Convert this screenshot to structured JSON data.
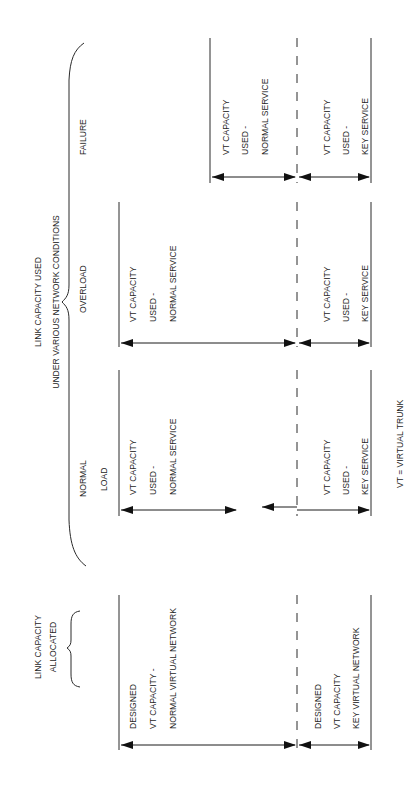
{
  "figure": {
    "orientation": "rotated-90-ccw",
    "headers": {
      "used_line1": "LINK CAPACITY USED",
      "used_line2": "UNDER VARIOUS NETWORK CONDITIONS",
      "allocated_line1": "LINK CAPACITY",
      "allocated_line2": "ALLOCATED"
    },
    "conditions": {
      "failure": "FAILURE",
      "overload": "OVERLOAD",
      "normal_line1": "NORMAL",
      "normal_line2": "LOAD"
    },
    "columns": {
      "failure": {
        "normal": [
          "VT CAPACITY",
          "USED -",
          "NORMAL SERVICE"
        ],
        "key": [
          "VT CAPACITY",
          "USED -",
          "KEY SERVICE"
        ]
      },
      "overload": {
        "normal": [
          "VT CAPACITY",
          "USED -",
          "NORMAL SERVICE"
        ],
        "key": [
          "VT CAPACITY",
          "USED -",
          "KEY SERVICE"
        ]
      },
      "normal_load": {
        "normal": [
          "VT CAPACITY",
          "USED -",
          "NORMAL SERVICE"
        ],
        "key": [
          "VT CAPACITY",
          "USED -",
          "KEY SERVICE"
        ]
      },
      "allocated": {
        "normal": [
          "DESIGNED",
          "VT CAPACITY -",
          "NORMAL VIRTUAL NETWORK"
        ],
        "key": [
          "DESIGNED",
          "VT CAPACITY",
          "KEY VIRTUAL NETWORK"
        ]
      }
    },
    "legend": "VT = VIRTUAL TRUNK"
  }
}
